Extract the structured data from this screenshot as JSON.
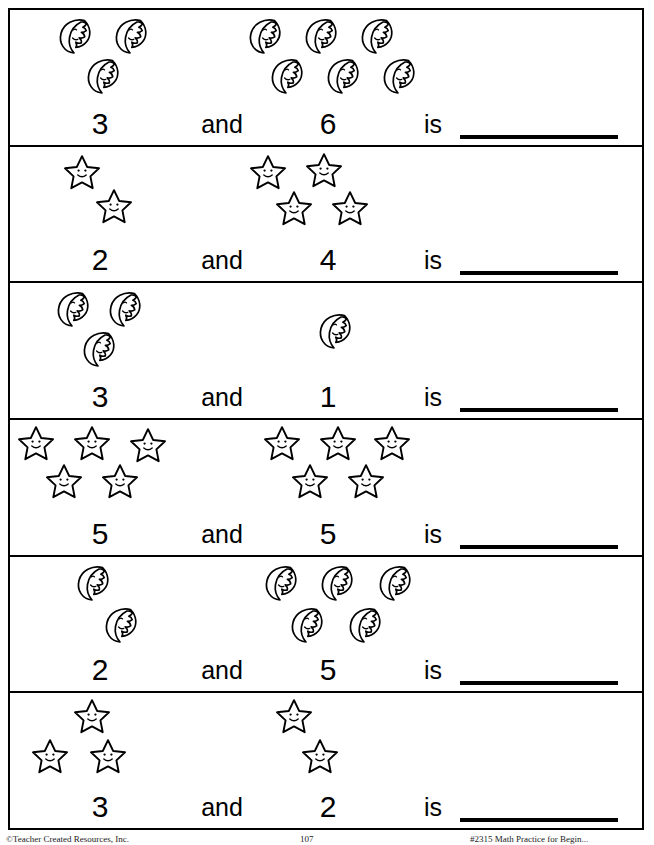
{
  "page": {
    "background_color": "#ffffff",
    "ink_color": "#000000",
    "width": 654,
    "height": 845
  },
  "labels": {
    "and": "and",
    "is": "is",
    "blank_answer": ""
  },
  "icons": {
    "moon": "moon-icon",
    "star": "star-icon"
  },
  "footer": {
    "left": "©Teacher Created Resources, Inc.",
    "middle": "107",
    "right": "#2315 Math Practice for Begin..."
  },
  "problems": [
    {
      "index": 1,
      "icon": "moon",
      "addend_a": "3",
      "addend_b": "6",
      "answer": "",
      "left_positions": [
        {
          "x": 44,
          "y": 2
        },
        {
          "x": 100,
          "y": 2
        },
        {
          "x": 72,
          "y": 42
        }
      ],
      "right_positions": [
        {
          "x": 4,
          "y": 2
        },
        {
          "x": 60,
          "y": 2
        },
        {
          "x": 116,
          "y": 2
        },
        {
          "x": 26,
          "y": 42
        },
        {
          "x": 82,
          "y": 42
        },
        {
          "x": 138,
          "y": 42
        }
      ]
    },
    {
      "index": 2,
      "icon": "star",
      "addend_a": "2",
      "addend_b": "4",
      "answer": "",
      "left_positions": [
        {
          "x": 52,
          "y": 2
        },
        {
          "x": 84,
          "y": 36
        }
      ],
      "right_positions": [
        {
          "x": 8,
          "y": 2
        },
        {
          "x": 64,
          "y": 0
        },
        {
          "x": 34,
          "y": 38
        },
        {
          "x": 90,
          "y": 38
        }
      ]
    },
    {
      "index": 3,
      "icon": "moon",
      "addend_a": "3",
      "addend_b": "1",
      "answer": "",
      "left_positions": [
        {
          "x": 42,
          "y": 2
        },
        {
          "x": 94,
          "y": 2
        },
        {
          "x": 68,
          "y": 42
        }
      ],
      "right_positions": [
        {
          "x": 74,
          "y": 24
        }
      ]
    },
    {
      "index": 4,
      "icon": "star",
      "addend_a": "5",
      "addend_b": "5",
      "answer": "",
      "left_positions": [
        {
          "x": 6,
          "y": 0
        },
        {
          "x": 62,
          "y": 0
        },
        {
          "x": 118,
          "y": 2
        },
        {
          "x": 34,
          "y": 38
        },
        {
          "x": 90,
          "y": 38
        }
      ],
      "right_positions": [
        {
          "x": 22,
          "y": 0
        },
        {
          "x": 78,
          "y": 0
        },
        {
          "x": 132,
          "y": 0
        },
        {
          "x": 50,
          "y": 38
        },
        {
          "x": 106,
          "y": 38
        }
      ]
    },
    {
      "index": 5,
      "icon": "moon",
      "addend_a": "2",
      "addend_b": "5",
      "answer": "",
      "left_positions": [
        {
          "x": 62,
          "y": 2
        },
        {
          "x": 90,
          "y": 44
        }
      ],
      "right_positions": [
        {
          "x": 20,
          "y": 2
        },
        {
          "x": 76,
          "y": 2
        },
        {
          "x": 134,
          "y": 2
        },
        {
          "x": 46,
          "y": 44
        },
        {
          "x": 104,
          "y": 44
        }
      ]
    },
    {
      "index": 6,
      "icon": "star",
      "addend_a": "3",
      "addend_b": "2",
      "answer": "",
      "left_positions": [
        {
          "x": 62,
          "y": 0
        },
        {
          "x": 20,
          "y": 40
        },
        {
          "x": 78,
          "y": 40
        }
      ],
      "right_positions": [
        {
          "x": 34,
          "y": 0
        },
        {
          "x": 60,
          "y": 40
        }
      ]
    }
  ]
}
